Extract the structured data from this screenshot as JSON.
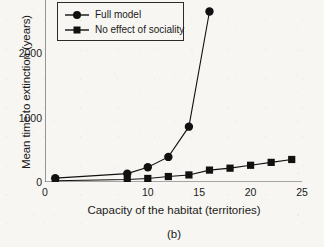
{
  "chart_data": {
    "type": "line",
    "title": "",
    "caption": "(b)",
    "xlabel": "Capacity of the habitat (territories)",
    "ylabel": "Mean time to extinction (years)",
    "xlim": [
      0,
      25
    ],
    "ylim": [
      0,
      3000
    ],
    "grid": false,
    "legend_position": "top-left",
    "xticks": [
      0,
      5,
      10,
      15,
      20,
      25
    ],
    "xtick_labels": [
      "0",
      "",
      "10",
      "15",
      "20",
      "25"
    ],
    "yticks": [
      0,
      1000,
      2000,
      3000
    ],
    "ytick_labels": [
      "0",
      "1000",
      "2000",
      "3000"
    ],
    "series": [
      {
        "name": "Full model",
        "marker": "circle",
        "color": "#111111",
        "x": [
          1,
          8,
          10,
          12,
          14,
          16
        ],
        "y": [
          60,
          130,
          230,
          390,
          860,
          2650
        ]
      },
      {
        "name": "No effect of sociality",
        "marker": "square",
        "color": "#111111",
        "x": [
          1,
          8,
          10,
          12,
          14,
          16,
          18,
          20,
          22,
          24
        ],
        "y": [
          20,
          40,
          55,
          85,
          110,
          185,
          215,
          260,
          305,
          350
        ]
      }
    ]
  },
  "legend": {
    "items": [
      {
        "label": "Full model",
        "marker": "circle"
      },
      {
        "label": "No effect of sociality",
        "marker": "square"
      }
    ]
  }
}
